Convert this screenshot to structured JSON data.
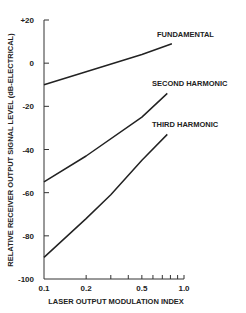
{
  "chart_data": {
    "type": "line",
    "title": "",
    "xlabel": "LASER OUTPUT MODULATION INDEX",
    "ylabel": "RELATIVE RECEIVER OUTPUT SIGNAL LEVEL (dB-ELECTRICAL)",
    "xscale": "log",
    "xlim": [
      0.1,
      1.0
    ],
    "ylim": [
      -100,
      20
    ],
    "x_tick_labels": [
      "0.1",
      "0.2",
      "0.5",
      "1.0"
    ],
    "x_ticks": [
      0.1,
      0.2,
      0.3,
      0.4,
      0.5,
      0.6,
      0.7,
      0.8,
      0.9,
      1.0
    ],
    "y_tick_labels": [
      "+20",
      "0",
      "-20",
      "-40",
      "-60",
      "-80",
      "-100"
    ],
    "y_ticks": [
      20,
      0,
      -20,
      -40,
      -60,
      -80,
      -100
    ],
    "grid": false,
    "legend": "inline labels at line ends",
    "series": [
      {
        "name": "FUNDAMENTAL",
        "x": [
          0.1,
          0.2,
          0.5,
          0.82
        ],
        "y": [
          -10,
          -4,
          4,
          9
        ]
      },
      {
        "name": "SECOND HARMONIC",
        "x": [
          0.1,
          0.2,
          0.5,
          0.76
        ],
        "y": [
          -55,
          -43,
          -25,
          -14
        ]
      },
      {
        "name": "THIRD HARMONIC",
        "x": [
          0.1,
          0.2,
          0.3,
          0.5,
          0.76
        ],
        "y": [
          -90,
          -72,
          -61,
          -45,
          -33
        ]
      }
    ]
  },
  "labels": {
    "series_fundamental": "FUNDAMENTAL",
    "series_second": "SECOND HARMONIC",
    "series_third": "THIRD HARMONIC"
  }
}
